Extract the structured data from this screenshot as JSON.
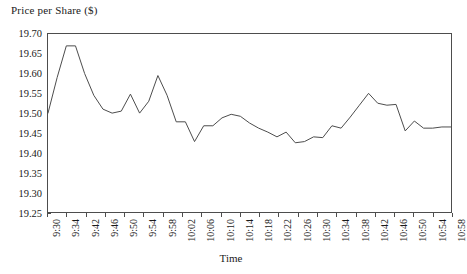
{
  "chart_data": {
    "type": "line",
    "title": "",
    "xlabel": "Time",
    "ylabel": "Price per Share ($)",
    "ylim": [
      19.25,
      19.7
    ],
    "ytick_labels": [
      "19.70",
      "19.65",
      "19.60",
      "19.55",
      "19.50",
      "19.45",
      "19.40",
      "19.35",
      "19.30",
      "19.25"
    ],
    "ytick_values": [
      19.7,
      19.65,
      19.6,
      19.55,
      19.5,
      19.45,
      19.4,
      19.35,
      19.3,
      19.25
    ],
    "grid": false,
    "legend": false,
    "line_color": "#4d4d4d",
    "xtick_labels": [
      "9:30",
      "9:34",
      "9:42",
      "9:46",
      "9:50",
      "9:54",
      "9:58",
      "10:02",
      "10:06",
      "10:10",
      "10:14",
      "10:18",
      "10:22",
      "10:26",
      "10:30",
      "10:34",
      "10:38",
      "10:42",
      "10:46",
      "10:50",
      "10:54",
      "10:58"
    ],
    "x": [
      "9:30",
      "9:32",
      "9:34",
      "9:36",
      "9:38",
      "9:40",
      "9:42",
      "9:44",
      "9:46",
      "9:48",
      "9:50",
      "9:52",
      "9:54",
      "9:56",
      "9:58",
      "10:00",
      "10:02",
      "10:04",
      "10:06",
      "10:08",
      "10:10",
      "10:12",
      "10:14",
      "10:16",
      "10:18",
      "10:20",
      "10:22",
      "10:24",
      "10:26",
      "10:28",
      "10:30",
      "10:32",
      "10:34",
      "10:36",
      "10:38",
      "10:40",
      "10:42",
      "10:44",
      "10:46",
      "10:48",
      "10:50",
      "10:52",
      "10:54",
      "10:56",
      "10:58"
    ],
    "series": [
      {
        "name": "Price per Share",
        "values": [
          19.5,
          19.59,
          19.67,
          19.67,
          19.6,
          19.545,
          19.51,
          19.5,
          19.505,
          19.548,
          19.5,
          19.53,
          19.595,
          19.545,
          19.478,
          19.478,
          19.428,
          19.468,
          19.468,
          19.488,
          19.497,
          19.492,
          19.475,
          19.462,
          19.452,
          19.44,
          19.452,
          19.425,
          19.428,
          19.44,
          19.438,
          19.468,
          19.462,
          19.49,
          19.52,
          19.55,
          19.525,
          19.52,
          19.522,
          19.455,
          19.48,
          19.462,
          19.462,
          19.465,
          19.465
        ]
      }
    ]
  }
}
